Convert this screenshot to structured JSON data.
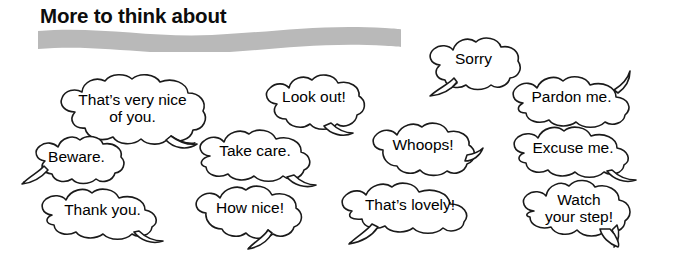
{
  "page": {
    "title": "More to think about",
    "background_color": "#ffffff",
    "wave_color": "#b9b9b9",
    "text_color": "#000000",
    "outline_color": "#1a1a1a"
  },
  "bubbles": [
    {
      "id": "thats-very-nice-of-you",
      "text": "That’s very nice\nof you.",
      "tail": "bottom-right"
    },
    {
      "id": "look-out",
      "text": "Look out!",
      "tail": "bottom-right"
    },
    {
      "id": "sorry",
      "text": "Sorry",
      "tail": "bottom-left"
    },
    {
      "id": "pardon-me",
      "text": "Pardon me.",
      "tail": "top-right"
    },
    {
      "id": "beware",
      "text": "Beware.",
      "tail": "bottom-left"
    },
    {
      "id": "take-care",
      "text": "Take care.",
      "tail": "bottom-right"
    },
    {
      "id": "whoops",
      "text": "Whoops!",
      "tail": "right"
    },
    {
      "id": "excuse-me",
      "text": "Excuse me.",
      "tail": "bottom-right"
    },
    {
      "id": "thank-you",
      "text": "Thank you.",
      "tail": "bottom-right"
    },
    {
      "id": "how-nice",
      "text": "How nice!",
      "tail": "bottom-center"
    },
    {
      "id": "thats-lovely",
      "text": "That’s lovely!",
      "tail": "bottom-left"
    },
    {
      "id": "watch-your-step",
      "text": "Watch\nyour step!",
      "tail": "bottom-right"
    }
  ]
}
